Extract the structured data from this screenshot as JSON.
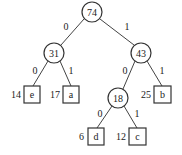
{
  "diagram": {
    "type": "huffman-tree",
    "internal_nodes": [
      {
        "id": "root",
        "weight": "74",
        "cx": 92,
        "cy": 12
      },
      {
        "id": "n31",
        "weight": "31",
        "cx": 54,
        "cy": 53
      },
      {
        "id": "n43",
        "weight": "43",
        "cx": 141,
        "cy": 53
      },
      {
        "id": "n18",
        "weight": "18",
        "cx": 118,
        "cy": 98
      }
    ],
    "leaves": [
      {
        "id": "e",
        "symbol": "e",
        "weight": "14",
        "x": 24,
        "y": 86
      },
      {
        "id": "a",
        "symbol": "a",
        "weight": "17",
        "x": 63,
        "y": 86
      },
      {
        "id": "b",
        "symbol": "b",
        "weight": "25",
        "x": 154,
        "y": 86
      },
      {
        "id": "d",
        "symbol": "d",
        "weight": "6",
        "x": 88,
        "y": 128
      },
      {
        "id": "c",
        "symbol": "c",
        "weight": "12",
        "x": 129,
        "y": 128
      }
    ],
    "edges": [
      {
        "from": "root",
        "to": "n31",
        "label": "0"
      },
      {
        "from": "root",
        "to": "n43",
        "label": "1"
      },
      {
        "from": "n31",
        "to": "e",
        "label": "0"
      },
      {
        "from": "n31",
        "to": "a",
        "label": "1"
      },
      {
        "from": "n43",
        "to": "n18",
        "label": "0"
      },
      {
        "from": "n43",
        "to": "b",
        "label": "1"
      },
      {
        "from": "n18",
        "to": "d",
        "label": "0"
      },
      {
        "from": "n18",
        "to": "c",
        "label": "1"
      }
    ],
    "edge_labels": {
      "root_left": "0",
      "root_right": "1",
      "n31_left": "0",
      "n31_right": "1",
      "n43_left": "0",
      "n43_right": "1",
      "n18_left": "0",
      "n18_right": "1"
    },
    "node_labels": {
      "root": "74",
      "n31": "31",
      "n43": "43",
      "n18": "18"
    },
    "leaf_labels": {
      "e": {
        "symbol": "e",
        "weight": "14"
      },
      "a": {
        "symbol": "a",
        "weight": "17"
      },
      "b": {
        "symbol": "b",
        "weight": "25"
      },
      "d": {
        "symbol": "d",
        "weight": "6"
      },
      "c": {
        "symbol": "c",
        "weight": "12"
      }
    }
  }
}
